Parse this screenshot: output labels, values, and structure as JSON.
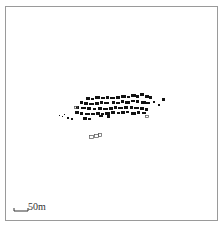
{
  "map": {
    "scale_bar": {
      "label": "50m",
      "x": 14,
      "y": 211,
      "length": 14
    },
    "colors": {
      "building": "#111111",
      "frame": "#9a9a9a",
      "outline": "#555555"
    },
    "buildings": [
      [
        86,
        97,
        4,
        3
      ],
      [
        91,
        98,
        3,
        2
      ],
      [
        95,
        96,
        5,
        3
      ],
      [
        101,
        97,
        4,
        2
      ],
      [
        106,
        96,
        3,
        3
      ],
      [
        110,
        97,
        5,
        2
      ],
      [
        116,
        96,
        4,
        3
      ],
      [
        121,
        95,
        5,
        3
      ],
      [
        127,
        96,
        3,
        2
      ],
      [
        131,
        94,
        5,
        3
      ],
      [
        136,
        95,
        3,
        3
      ],
      [
        140,
        93,
        4,
        3
      ],
      [
        145,
        95,
        4,
        3
      ],
      [
        149,
        96,
        3,
        3
      ],
      [
        80,
        101,
        3,
        3
      ],
      [
        84,
        102,
        4,
        3
      ],
      [
        89,
        103,
        5,
        2
      ],
      [
        95,
        102,
        4,
        3
      ],
      [
        100,
        101,
        3,
        3
      ],
      [
        104,
        102,
        5,
        2
      ],
      [
        112,
        101,
        3,
        3
      ],
      [
        116,
        102,
        4,
        2
      ],
      [
        121,
        100,
        3,
        3
      ],
      [
        125,
        101,
        5,
        3
      ],
      [
        131,
        100,
        4,
        2
      ],
      [
        136,
        100,
        3,
        3
      ],
      [
        141,
        101,
        5,
        3
      ],
      [
        146,
        102,
        4,
        2
      ],
      [
        76,
        106,
        3,
        3
      ],
      [
        81,
        107,
        5,
        2
      ],
      [
        87,
        107,
        4,
        3
      ],
      [
        93,
        108,
        3,
        2
      ],
      [
        98,
        107,
        4,
        3
      ],
      [
        103,
        108,
        5,
        2
      ],
      [
        109,
        107,
        4,
        3
      ],
      [
        114,
        106,
        3,
        3
      ],
      [
        118,
        107,
        5,
        2
      ],
      [
        124,
        106,
        4,
        3
      ],
      [
        130,
        106,
        3,
        3
      ],
      [
        134,
        107,
        5,
        2
      ],
      [
        140,
        107,
        4,
        3
      ],
      [
        145,
        108,
        3,
        3
      ],
      [
        75,
        111,
        4,
        3
      ],
      [
        80,
        112,
        3,
        3
      ],
      [
        85,
        113,
        5,
        2
      ],
      [
        91,
        113,
        4,
        2
      ],
      [
        96,
        112,
        4,
        3
      ],
      [
        101,
        113,
        3,
        2
      ],
      [
        105,
        112,
        5,
        3
      ],
      [
        111,
        111,
        4,
        3
      ],
      [
        117,
        112,
        3,
        2
      ],
      [
        121,
        111,
        4,
        3
      ],
      [
        126,
        111,
        3,
        2
      ],
      [
        131,
        112,
        5,
        3
      ],
      [
        137,
        111,
        3,
        3
      ],
      [
        142,
        112,
        4,
        2
      ],
      [
        83,
        117,
        4,
        3
      ],
      [
        88,
        118,
        3,
        2
      ],
      [
        99,
        115,
        4,
        2
      ],
      [
        107,
        115,
        3,
        3
      ],
      [
        153,
        101,
        2,
        2
      ],
      [
        162,
        98,
        3,
        3
      ],
      [
        158,
        104,
        2,
        2
      ],
      [
        59,
        115,
        1,
        1
      ],
      [
        62,
        116,
        1,
        1
      ],
      [
        64,
        114,
        1,
        1
      ],
      [
        67,
        117,
        2,
        2
      ],
      [
        71,
        118,
        2,
        2
      ]
    ],
    "outlined_buildings": [
      [
        89,
        135,
        4,
        3
      ],
      [
        94,
        134,
        4,
        3
      ],
      [
        98,
        133,
        3,
        3
      ],
      [
        74,
        106,
        3,
        2
      ],
      [
        145,
        115,
        3,
        2
      ]
    ]
  }
}
